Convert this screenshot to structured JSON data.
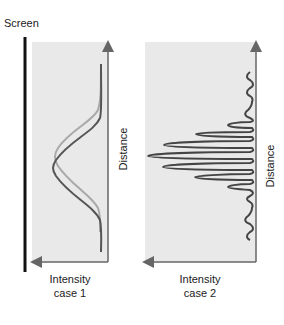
{
  "labels": {
    "screen": "Screen",
    "panel1_x_title": "Intensity",
    "panel1_x_sub": "case 1",
    "panel1_y": "Distance",
    "panel2_x_title": "Intensity",
    "panel2_x_sub": "case 2",
    "panel2_y": "Distance"
  },
  "colors": {
    "panel_bg": "#e9e9e9",
    "axis": "#666666",
    "screen_line": "#111111",
    "curve_light": "#a8a8a8",
    "curve_dark": "#555555",
    "curve_fringes": "#444444"
  },
  "panels": [
    {
      "name": "case 1",
      "description": "Two overlapping broad Gaussian-like intensity profiles, offset vertically"
    },
    {
      "name": "case 2",
      "description": "Interference fringe pattern with a central maximum and decreasing side peaks"
    }
  ]
}
